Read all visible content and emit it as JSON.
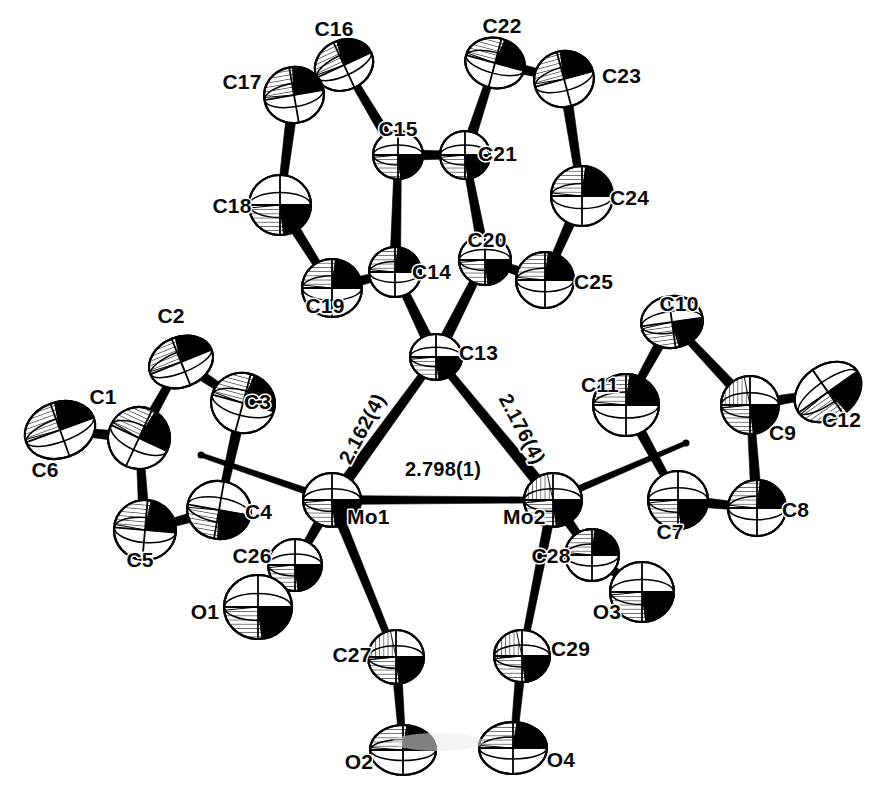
{
  "figure": {
    "type": "ortep-crystal-structure-diagram",
    "title": "",
    "caption": "",
    "background_color": "#ffffff",
    "line_color": "#000000",
    "label_color": "#0b0b0b"
  },
  "molecule": {
    "name": "Dimolybdenum alkylidyne carbonyl complex",
    "metal_atoms": [
      "Mo1",
      "Mo2"
    ],
    "bridging_carbon": "C13"
  },
  "bond_distance_labels": [
    {
      "id": "mo1-c13",
      "text": "2.162(4)",
      "between": [
        "Mo1",
        "C13"
      ],
      "x": 368,
      "y": 432,
      "rotation": -62
    },
    {
      "id": "mo2-c13",
      "text": "2.176(4)",
      "between": [
        "Mo2",
        "C13"
      ],
      "x": 516,
      "y": 432,
      "rotation": 62
    },
    {
      "id": "mo1-mo2",
      "text": "2.798(1)",
      "between": [
        "Mo1",
        "Mo2"
      ],
      "x": 443,
      "y": 476,
      "rotation": 0
    }
  ],
  "atom_labels": [
    {
      "label": "C1",
      "x": 103,
      "y": 404,
      "anchor": "middle"
    },
    {
      "label": "C2",
      "x": 171,
      "y": 323,
      "anchor": "middle"
    },
    {
      "label": "C3",
      "x": 244,
      "y": 409,
      "anchor": "start"
    },
    {
      "label": "C4",
      "x": 245,
      "y": 519,
      "anchor": "start"
    },
    {
      "label": "C5",
      "x": 140,
      "y": 567,
      "anchor": "middle"
    },
    {
      "label": "C6",
      "x": 45,
      "y": 477,
      "anchor": "middle"
    },
    {
      "label": "C7",
      "x": 670,
      "y": 539,
      "anchor": "middle"
    },
    {
      "label": "C8",
      "x": 782,
      "y": 517,
      "anchor": "start"
    },
    {
      "label": "C9",
      "x": 769,
      "y": 440,
      "anchor": "start"
    },
    {
      "label": "C10",
      "x": 679,
      "y": 311,
      "anchor": "middle"
    },
    {
      "label": "C11",
      "x": 600,
      "y": 392,
      "anchor": "middle"
    },
    {
      "label": "C12",
      "x": 822,
      "y": 427,
      "anchor": "start"
    },
    {
      "label": "C13",
      "x": 459,
      "y": 360,
      "anchor": "start"
    },
    {
      "label": "C14",
      "x": 412,
      "y": 279,
      "anchor": "start"
    },
    {
      "label": "C15",
      "x": 398,
      "y": 136,
      "anchor": "middle"
    },
    {
      "label": "C16",
      "x": 334,
      "y": 36,
      "anchor": "middle"
    },
    {
      "label": "C17",
      "x": 242,
      "y": 89,
      "anchor": "middle"
    },
    {
      "label": "C18",
      "x": 232,
      "y": 213,
      "anchor": "middle"
    },
    {
      "label": "C19",
      "x": 325,
      "y": 313,
      "anchor": "middle"
    },
    {
      "label": "C20",
      "x": 487,
      "y": 247,
      "anchor": "middle"
    },
    {
      "label": "C21",
      "x": 478,
      "y": 161,
      "anchor": "start"
    },
    {
      "label": "C22",
      "x": 502,
      "y": 33,
      "anchor": "middle"
    },
    {
      "label": "C23",
      "x": 602,
      "y": 83,
      "anchor": "start"
    },
    {
      "label": "C24",
      "x": 610,
      "y": 205,
      "anchor": "start"
    },
    {
      "label": "C25",
      "x": 574,
      "y": 289,
      "anchor": "start"
    },
    {
      "label": "C26",
      "x": 252,
      "y": 563,
      "anchor": "middle"
    },
    {
      "label": "C27",
      "x": 352,
      "y": 662,
      "anchor": "middle"
    },
    {
      "label": "C28",
      "x": 551,
      "y": 563,
      "anchor": "middle"
    },
    {
      "label": "C29",
      "x": 551,
      "y": 656,
      "anchor": "start"
    },
    {
      "label": "O1",
      "x": 205,
      "y": 619,
      "anchor": "middle"
    },
    {
      "label": "O2",
      "x": 359,
      "y": 769,
      "anchor": "middle"
    },
    {
      "label": "O3",
      "x": 607,
      "y": 619,
      "anchor": "middle"
    },
    {
      "label": "O4",
      "x": 561,
      "y": 767,
      "anchor": "middle"
    },
    {
      "label": "Mo1",
      "x": 347,
      "y": 524,
      "anchor": "start"
    },
    {
      "label": "Mo2",
      "x": 503,
      "y": 524,
      "anchor": "start"
    }
  ],
  "atoms": [
    {
      "id": "C1",
      "x": 139,
      "y": 438,
      "rx": 31,
      "ry": 31,
      "rot": 25,
      "style": "hatch-upper"
    },
    {
      "id": "C2",
      "x": 181,
      "y": 362,
      "rx": 33,
      "ry": 25,
      "rot": -22,
      "style": "hatch-upper"
    },
    {
      "id": "C3",
      "x": 243,
      "y": 403,
      "rx": 32,
      "ry": 30,
      "rot": 15,
      "style": "hatch-upper"
    },
    {
      "id": "C4",
      "x": 219,
      "y": 510,
      "rx": 32,
      "ry": 29,
      "rot": 10,
      "style": "hatch-lower"
    },
    {
      "id": "C5",
      "x": 145,
      "y": 530,
      "rx": 31,
      "ry": 30,
      "rot": 5,
      "style": "hatch-upper"
    },
    {
      "id": "C6",
      "x": 60,
      "y": 430,
      "rx": 36,
      "ry": 28,
      "rot": -20,
      "style": "hatch-upper"
    },
    {
      "id": "C7",
      "x": 678,
      "y": 500,
      "rx": 30,
      "ry": 29,
      "rot": 0,
      "style": "hatch-lower"
    },
    {
      "id": "C8",
      "x": 757,
      "y": 508,
      "rx": 29,
      "ry": 28,
      "rot": 0,
      "style": "hatch-upper"
    },
    {
      "id": "C9",
      "x": 750,
      "y": 405,
      "rx": 29,
      "ry": 29,
      "rot": 0,
      "style": "hatch-dark"
    },
    {
      "id": "C10",
      "x": 672,
      "y": 322,
      "rx": 31,
      "ry": 26,
      "rot": -8,
      "style": "hatch-lower"
    },
    {
      "id": "C11",
      "x": 626,
      "y": 405,
      "rx": 33,
      "ry": 31,
      "rot": 0,
      "style": "hatch-upper"
    },
    {
      "id": "C12",
      "x": 828,
      "y": 392,
      "rx": 36,
      "ry": 27,
      "rot": -35,
      "style": "hatch-lower"
    },
    {
      "id": "C13",
      "x": 436,
      "y": 357,
      "rx": 26,
      "ry": 23,
      "rot": 0,
      "style": "hatch-lower"
    },
    {
      "id": "C14",
      "x": 395,
      "y": 272,
      "rx": 26,
      "ry": 25,
      "rot": 0,
      "style": "hatch-upper"
    },
    {
      "id": "C15",
      "x": 398,
      "y": 155,
      "rx": 25,
      "ry": 24,
      "rot": 0,
      "style": "hatch-lower"
    },
    {
      "id": "C16",
      "x": 344,
      "y": 65,
      "rx": 30,
      "ry": 25,
      "rot": -25,
      "style": "hatch-upper"
    },
    {
      "id": "C17",
      "x": 294,
      "y": 95,
      "rx": 30,
      "ry": 28,
      "rot": -10,
      "style": "hatch-upper"
    },
    {
      "id": "C18",
      "x": 280,
      "y": 205,
      "rx": 31,
      "ry": 30,
      "rot": 0,
      "style": "hatch-lower"
    },
    {
      "id": "C19",
      "x": 332,
      "y": 288,
      "rx": 30,
      "ry": 29,
      "rot": 0,
      "style": "hatch-upper"
    },
    {
      "id": "C20",
      "x": 485,
      "y": 260,
      "rx": 26,
      "ry": 25,
      "rot": 0,
      "style": "hatch-lower"
    },
    {
      "id": "C21",
      "x": 465,
      "y": 155,
      "rx": 25,
      "ry": 24,
      "rot": 0,
      "style": "hatch-lower"
    },
    {
      "id": "C22",
      "x": 495,
      "y": 63,
      "rx": 30,
      "ry": 25,
      "rot": 15,
      "style": "hatch-upper"
    },
    {
      "id": "C23",
      "x": 564,
      "y": 79,
      "rx": 30,
      "ry": 28,
      "rot": -15,
      "style": "hatch-upper"
    },
    {
      "id": "C24",
      "x": 582,
      "y": 196,
      "rx": 31,
      "ry": 30,
      "rot": 0,
      "style": "hatch-upper"
    },
    {
      "id": "C25",
      "x": 545,
      "y": 280,
      "rx": 29,
      "ry": 28,
      "rot": 0,
      "style": "hatch-upper"
    },
    {
      "id": "C26",
      "x": 295,
      "y": 565,
      "rx": 27,
      "ry": 26,
      "rot": 0,
      "style": "hatch-lower"
    },
    {
      "id": "C27",
      "x": 396,
      "y": 657,
      "rx": 28,
      "ry": 27,
      "rot": 0,
      "style": "hatch-dark"
    },
    {
      "id": "C28",
      "x": 592,
      "y": 555,
      "rx": 27,
      "ry": 26,
      "rot": 0,
      "style": "hatch-upper"
    },
    {
      "id": "C29",
      "x": 522,
      "y": 656,
      "rx": 28,
      "ry": 26,
      "rot": 0,
      "style": "hatch-dark"
    },
    {
      "id": "O1",
      "x": 258,
      "y": 607,
      "rx": 34,
      "ry": 32,
      "rot": 0,
      "style": "hatch-lower"
    },
    {
      "id": "O2",
      "x": 403,
      "y": 750,
      "rx": 33,
      "ry": 25,
      "rot": 0,
      "style": "hatch-upper"
    },
    {
      "id": "O3",
      "x": 642,
      "y": 592,
      "rx": 32,
      "ry": 30,
      "rot": 0,
      "style": "hatch-lower"
    },
    {
      "id": "O4",
      "x": 513,
      "y": 748,
      "rx": 34,
      "ry": 26,
      "rot": 0,
      "style": "hatch-upper"
    },
    {
      "id": "Mo1",
      "x": 332,
      "y": 500,
      "rx": 29,
      "ry": 27,
      "rot": 0,
      "style": "hatch-lower"
    },
    {
      "id": "Mo2",
      "x": 553,
      "y": 500,
      "rx": 29,
      "ry": 27,
      "rot": 0,
      "style": "hatch-dark"
    }
  ],
  "bonds": [
    {
      "from": "Mo1",
      "to": "Mo2",
      "w": 9
    },
    {
      "from": "Mo1",
      "to": "C13",
      "w": 12
    },
    {
      "from": "Mo2",
      "to": "C13",
      "w": 12
    },
    {
      "from": "C13",
      "to": "C14",
      "w": 12
    },
    {
      "from": "C13",
      "to": "C20",
      "w": 12
    },
    {
      "from": "C14",
      "to": "C15",
      "w": 11
    },
    {
      "from": "C15",
      "to": "C16",
      "w": 11
    },
    {
      "from": "C16",
      "to": "C17",
      "w": 11
    },
    {
      "from": "C17",
      "to": "C18",
      "w": 11
    },
    {
      "from": "C18",
      "to": "C19",
      "w": 11
    },
    {
      "from": "C19",
      "to": "C14",
      "w": 11
    },
    {
      "from": "C15",
      "to": "C21",
      "w": 11
    },
    {
      "from": "C20",
      "to": "C21",
      "w": 11
    },
    {
      "from": "C21",
      "to": "C22",
      "w": 11
    },
    {
      "from": "C22",
      "to": "C23",
      "w": 11
    },
    {
      "from": "C23",
      "to": "C24",
      "w": 11
    },
    {
      "from": "C24",
      "to": "C25",
      "w": 11
    },
    {
      "from": "C25",
      "to": "C20",
      "w": 11
    },
    {
      "from": "C1",
      "to": "C2",
      "w": 11
    },
    {
      "from": "C2",
      "to": "C3",
      "w": 11
    },
    {
      "from": "C3",
      "to": "C4",
      "w": 11
    },
    {
      "from": "C4",
      "to": "C5",
      "w": 11
    },
    {
      "from": "C5",
      "to": "C1",
      "w": 11
    },
    {
      "from": "C1",
      "to": "C6",
      "w": 11
    },
    {
      "from": "C7",
      "to": "C8",
      "w": 11
    },
    {
      "from": "C8",
      "to": "C9",
      "w": 11
    },
    {
      "from": "C9",
      "to": "C10",
      "w": 11
    },
    {
      "from": "C10",
      "to": "C11",
      "w": 11
    },
    {
      "from": "C11",
      "to": "C7",
      "w": 11
    },
    {
      "from": "C9",
      "to": "C12",
      "w": 11
    },
    {
      "from": "Mo1",
      "to": "C26",
      "w": 11
    },
    {
      "from": "C26",
      "to": "O1",
      "w": 11
    },
    {
      "from": "Mo1",
      "to": "C27",
      "w": 10
    },
    {
      "from": "C27",
      "to": "O2",
      "w": 10
    },
    {
      "from": "Mo2",
      "to": "C28",
      "w": 11
    },
    {
      "from": "C28",
      "to": "O3",
      "w": 11
    },
    {
      "from": "Mo2",
      "to": "C29",
      "w": 10
    },
    {
      "from": "C29",
      "to": "O4",
      "w": 10
    }
  ],
  "centroid_bonds": [
    {
      "from": "Mo1",
      "x2": 201,
      "y2": 455,
      "w": 7
    },
    {
      "from": "Mo2",
      "x2": 686,
      "y2": 443,
      "w": 7
    }
  ]
}
